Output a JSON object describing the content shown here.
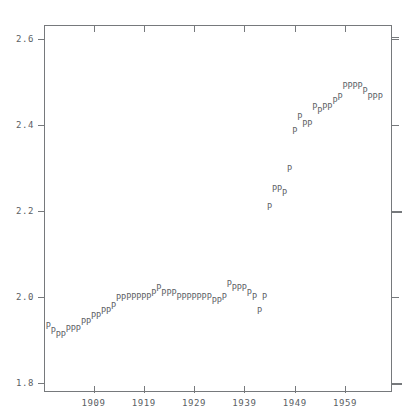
{
  "chart_data": {
    "type": "scatter",
    "title": "",
    "subtitle": "",
    "xlabel": "",
    "ylabel": "",
    "marker_glyph": "P",
    "marker_color": "#5f6468",
    "frame_color": "#76797c",
    "background": "#ffffff",
    "grid": false,
    "legend": null,
    "xlim": [
      1899,
      1968
    ],
    "ylim": [
      1.8,
      2.6
    ],
    "xticks": [
      1909,
      1919,
      1929,
      1939,
      1949,
      1959
    ],
    "xtick_labels": [
      "1909",
      "1919",
      "1929",
      "1939",
      "1949",
      "1959"
    ],
    "yticks": [
      1.8,
      2.0,
      2.2,
      2.4,
      2.6
    ],
    "ytick_labels": [
      "1.8",
      "2.0",
      "2.2",
      "2.4",
      "2.6"
    ],
    "x": [
      1900,
      1901,
      1902,
      1903,
      1904,
      1905,
      1906,
      1907,
      1908,
      1909,
      1910,
      1911,
      1912,
      1913,
      1914,
      1915,
      1916,
      1917,
      1918,
      1919,
      1920,
      1921,
      1922,
      1923,
      1924,
      1925,
      1926,
      1927,
      1928,
      1929,
      1930,
      1931,
      1932,
      1933,
      1934,
      1935,
      1936,
      1937,
      1938,
      1939,
      1940,
      1941,
      1942,
      1943,
      1944,
      1945,
      1946,
      1947,
      1948,
      1949,
      1950,
      1951,
      1952,
      1953,
      1954,
      1955,
      1956,
      1957,
      1958,
      1959,
      1960,
      1961,
      1962,
      1963,
      1964,
      1965,
      1966
    ],
    "y": [
      1.932,
      1.921,
      1.911,
      1.911,
      1.926,
      1.926,
      1.926,
      1.943,
      1.943,
      1.956,
      1.956,
      1.967,
      1.967,
      1.98,
      1.998,
      1.998,
      2.0,
      2.0,
      2.0,
      2.0,
      2.0,
      2.01,
      2.021,
      2.01,
      2.01,
      2.01,
      2.0,
      2.0,
      2.0,
      2.0,
      2.0,
      2.0,
      2.0,
      1.991,
      1.991,
      2.0,
      2.031,
      2.021,
      2.021,
      2.021,
      2.01,
      2.0,
      1.967,
      2.0,
      2.21,
      2.252,
      2.252,
      2.242,
      2.298,
      2.387,
      2.419,
      2.403,
      2.403,
      2.443,
      2.432,
      2.443,
      2.443,
      2.455,
      2.466,
      2.49,
      2.49,
      2.49,
      2.49,
      2.478,
      2.466,
      2.466,
      2.466
    ],
    "points": [
      {
        "x": 1900,
        "y": 1.932
      },
      {
        "x": 1901,
        "y": 1.921
      },
      {
        "x": 1902,
        "y": 1.911
      },
      {
        "x": 1903,
        "y": 1.911
      },
      {
        "x": 1904,
        "y": 1.926
      },
      {
        "x": 1905,
        "y": 1.926
      },
      {
        "x": 1906,
        "y": 1.926
      },
      {
        "x": 1907,
        "y": 1.943
      },
      {
        "x": 1908,
        "y": 1.943
      },
      {
        "x": 1909,
        "y": 1.956
      },
      {
        "x": 1910,
        "y": 1.956
      },
      {
        "x": 1911,
        "y": 1.967
      },
      {
        "x": 1912,
        "y": 1.967
      },
      {
        "x": 1913,
        "y": 1.98
      },
      {
        "x": 1914,
        "y": 1.998
      },
      {
        "x": 1915,
        "y": 1.998
      },
      {
        "x": 1916,
        "y": 2.0
      },
      {
        "x": 1917,
        "y": 2.0
      },
      {
        "x": 1918,
        "y": 2.0
      },
      {
        "x": 1919,
        "y": 2.0
      },
      {
        "x": 1920,
        "y": 2.0
      },
      {
        "x": 1921,
        "y": 2.01
      },
      {
        "x": 1922,
        "y": 2.021
      },
      {
        "x": 1923,
        "y": 2.01
      },
      {
        "x": 1924,
        "y": 2.01
      },
      {
        "x": 1925,
        "y": 2.01
      },
      {
        "x": 1926,
        "y": 2.0
      },
      {
        "x": 1927,
        "y": 2.0
      },
      {
        "x": 1928,
        "y": 2.0
      },
      {
        "x": 1929,
        "y": 2.0
      },
      {
        "x": 1930,
        "y": 2.0
      },
      {
        "x": 1931,
        "y": 2.0
      },
      {
        "x": 1932,
        "y": 2.0
      },
      {
        "x": 1933,
        "y": 1.991
      },
      {
        "x": 1934,
        "y": 1.991
      },
      {
        "x": 1935,
        "y": 2.0
      },
      {
        "x": 1936,
        "y": 2.031
      },
      {
        "x": 1937,
        "y": 2.021
      },
      {
        "x": 1938,
        "y": 2.021
      },
      {
        "x": 1939,
        "y": 2.021
      },
      {
        "x": 1940,
        "y": 2.01
      },
      {
        "x": 1941,
        "y": 2.0
      },
      {
        "x": 1942,
        "y": 1.967
      },
      {
        "x": 1943,
        "y": 2.0
      },
      {
        "x": 1944,
        "y": 2.21
      },
      {
        "x": 1945,
        "y": 2.252
      },
      {
        "x": 1946,
        "y": 2.252
      },
      {
        "x": 1947,
        "y": 2.242
      },
      {
        "x": 1948,
        "y": 2.298
      },
      {
        "x": 1949,
        "y": 2.387
      },
      {
        "x": 1950,
        "y": 2.419
      },
      {
        "x": 1951,
        "y": 2.403
      },
      {
        "x": 1952,
        "y": 2.403
      },
      {
        "x": 1953,
        "y": 2.443
      },
      {
        "x": 1954,
        "y": 2.432
      },
      {
        "x": 1955,
        "y": 2.443
      },
      {
        "x": 1956,
        "y": 2.443
      },
      {
        "x": 1957,
        "y": 2.455
      },
      {
        "x": 1958,
        "y": 2.466
      },
      {
        "x": 1959,
        "y": 2.49
      },
      {
        "x": 1960,
        "y": 2.49
      },
      {
        "x": 1961,
        "y": 2.49
      },
      {
        "x": 1962,
        "y": 2.49
      },
      {
        "x": 1963,
        "y": 2.478
      },
      {
        "x": 1964,
        "y": 2.466
      },
      {
        "x": 1965,
        "y": 2.466
      },
      {
        "x": 1966,
        "y": 2.466
      }
    ]
  },
  "geometry": {
    "plot_left": 44,
    "plot_top": 25,
    "plot_right": 392,
    "plot_bottom": 392,
    "x_pixel_per_year": 5.03,
    "x_origin_year": 1909,
    "x_origin_px": 93.5,
    "y_2p0_px": 297,
    "y_pixel_per_unit": 430
  }
}
